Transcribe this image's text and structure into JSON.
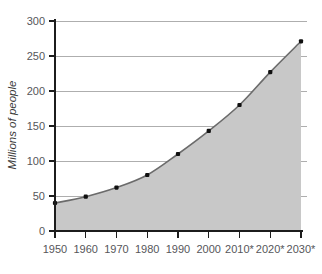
{
  "chart_data": {
    "type": "area",
    "title": "",
    "subtitle": "",
    "xlabel": "",
    "ylabel": "Millions of people",
    "x": [
      "1950",
      "1960",
      "1970",
      "1980",
      "1990",
      "2000",
      "2010*",
      "2020*",
      "2030*"
    ],
    "categories": [
      "1950",
      "1960",
      "1970",
      "1980",
      "1990",
      "2000",
      "2010*",
      "2020*",
      "2030*"
    ],
    "values": [
      40,
      49,
      62,
      80,
      110,
      143,
      180,
      227,
      271
    ],
    "series": [
      {
        "name": "Millions of people",
        "values": [
          40,
          49,
          62,
          80,
          110,
          143,
          180,
          227,
          271
        ]
      }
    ],
    "ylim": [
      0,
      300
    ],
    "y_ticks": [
      0,
      50,
      100,
      150,
      200,
      250,
      300
    ],
    "y_tick_labels": [
      "0",
      "50",
      "100",
      "150",
      "200",
      "250",
      "300"
    ],
    "x_tick_labels": [
      "1950",
      "1960",
      "1970",
      "1980",
      "1990",
      "2000",
      "2010*",
      "2020*",
      "2030*"
    ],
    "grid": true,
    "grid_axis": "y",
    "legend": false,
    "legend_position": "none",
    "annotations": [],
    "colors": {
      "area_fill": "#c8c8c8",
      "line": "#6b6b6b",
      "marker": "#101010",
      "gridline": "#9a9a9a",
      "axis": "#1c1c1c",
      "tick_label": "#56565a",
      "axis_title": "#3c3c3c",
      "background": "#ffffff"
    }
  }
}
